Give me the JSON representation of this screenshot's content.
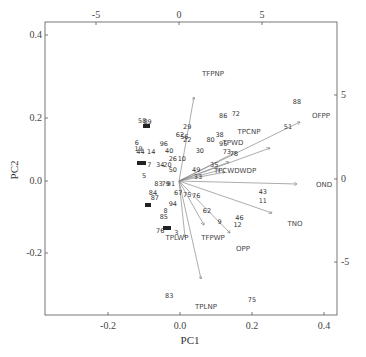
{
  "chart_data": {
    "type": "scatter",
    "subtype": "pca-biplot",
    "title": "",
    "xlabel": "PC1",
    "ylabel": "PC2",
    "xlim": [
      -0.37,
      0.44
    ],
    "ylim": [
      -0.42,
      0.44
    ],
    "xticks": [
      "-0.2",
      "0.0",
      "0.2",
      "0.4"
    ],
    "yticks": [
      "0.4",
      "0.2",
      "0.0",
      "-0.2"
    ],
    "top_ticks": [
      "-5",
      "0",
      "5"
    ],
    "right_ticks": [
      "5",
      "0",
      "-5"
    ],
    "grid": false,
    "legend": null,
    "variables": [
      {
        "name": "TFPNP",
        "end": [
          0.025,
          0.265
        ]
      },
      {
        "name": "OFPP",
        "end": [
          0.35,
          0.17
        ]
      },
      {
        "name": "TPCNP",
        "end": [
          0.25,
          0.09
        ]
      },
      {
        "name": "TPWD",
        "end": [
          0.2,
          0.06
        ]
      },
      {
        "name": "TPCWDWDP",
        "end": [
          0.2,
          0.02
        ]
      },
      {
        "name": "OND",
        "end": [
          0.33,
          -0.005
        ]
      },
      {
        "name": "TNO",
        "end": [
          0.27,
          -0.11
        ]
      },
      {
        "name": "OPP",
        "end": [
          0.2,
          -0.17
        ]
      },
      {
        "name": "TFPWP",
        "end": [
          0.14,
          -0.125
        ]
      },
      {
        "name": "TPLWP",
        "end": [
          0.06,
          -0.17
        ]
      },
      {
        "name": "TPLNP",
        "end": [
          0.065,
          -0.28
        ]
      }
    ],
    "observations": [
      {
        "label": "88",
        "x": 0.325,
        "y": 0.245
      },
      {
        "label": "51",
        "x": 0.3,
        "y": 0.165
      },
      {
        "label": "86",
        "x": 0.12,
        "y": 0.2
      },
      {
        "label": "72",
        "x": 0.155,
        "y": 0.205
      },
      {
        "label": "29",
        "x": 0.02,
        "y": 0.165
      },
      {
        "label": "38",
        "x": 0.11,
        "y": 0.14
      },
      {
        "label": "80",
        "x": 0.085,
        "y": 0.125
      },
      {
        "label": "95",
        "x": 0.12,
        "y": 0.11
      },
      {
        "label": "73",
        "x": 0.13,
        "y": 0.085
      },
      {
        "label": "78",
        "x": 0.15,
        "y": 0.08
      },
      {
        "label": "30",
        "x": 0.055,
        "y": 0.09
      },
      {
        "label": "62",
        "x": 0.0,
        "y": 0.14
      },
      {
        "label": "56",
        "x": 0.012,
        "y": 0.135
      },
      {
        "label": "22",
        "x": 0.02,
        "y": 0.125
      },
      {
        "label": "58",
        "x": -0.105,
        "y": 0.185
      },
      {
        "label": "89",
        "x": -0.09,
        "y": 0.18
      },
      {
        "label": "6",
        "x": -0.12,
        "y": 0.115
      },
      {
        "label": "19",
        "x": -0.115,
        "y": 0.095
      },
      {
        "label": "14",
        "x": -0.08,
        "y": 0.085
      },
      {
        "label": "44",
        "x": -0.11,
        "y": 0.085
      },
      {
        "label": "96",
        "x": -0.045,
        "y": 0.11
      },
      {
        "label": "40",
        "x": -0.03,
        "y": 0.09
      },
      {
        "label": "26",
        "x": -0.02,
        "y": 0.065
      },
      {
        "label": "10",
        "x": 0.005,
        "y": 0.065
      },
      {
        "label": "7",
        "x": -0.085,
        "y": 0.045
      },
      {
        "label": "34",
        "x": -0.055,
        "y": 0.045
      },
      {
        "label": "20",
        "x": -0.035,
        "y": 0.045
      },
      {
        "label": "50",
        "x": -0.02,
        "y": 0.03
      },
      {
        "label": "5",
        "x": -0.1,
        "y": 0.01
      },
      {
        "label": "43",
        "x": 0.23,
        "y": -0.04
      },
      {
        "label": "11",
        "x": 0.23,
        "y": -0.07
      },
      {
        "label": "35",
        "x": 0.095,
        "y": 0.045
      },
      {
        "label": "49",
        "x": 0.045,
        "y": 0.03
      },
      {
        "label": "33",
        "x": 0.05,
        "y": 0.005
      },
      {
        "label": "83",
        "x": -0.06,
        "y": -0.015
      },
      {
        "label": "79",
        "x": -0.04,
        "y": -0.015
      },
      {
        "label": "91",
        "x": -0.025,
        "y": -0.015
      },
      {
        "label": "67",
        "x": -0.005,
        "y": -0.045
      },
      {
        "label": "75",
        "x": 0.02,
        "y": -0.05
      },
      {
        "label": "76",
        "x": 0.045,
        "y": -0.055
      },
      {
        "label": "84",
        "x": -0.075,
        "y": -0.045
      },
      {
        "label": "87",
        "x": -0.07,
        "y": -0.06
      },
      {
        "label": "94",
        "x": -0.02,
        "y": -0.08
      },
      {
        "label": "8",
        "x": -0.04,
        "y": -0.1
      },
      {
        "label": "85",
        "x": -0.045,
        "y": -0.12
      },
      {
        "label": "62",
        "x": 0.075,
        "y": -0.1
      },
      {
        "label": "9",
        "x": 0.11,
        "y": -0.135
      },
      {
        "label": "46",
        "x": 0.165,
        "y": -0.125
      },
      {
        "label": "12",
        "x": 0.16,
        "y": -0.145
      },
      {
        "label": "76",
        "x": -0.055,
        "y": -0.165
      },
      {
        "label": "3",
        "x": -0.01,
        "y": -0.17
      },
      {
        "label": "83",
        "x": -0.03,
        "y": -0.37
      },
      {
        "label": "75",
        "x": 0.2,
        "y": -0.385
      }
    ]
  },
  "axes": {
    "x_label": "PC1",
    "y_label": "PC2",
    "bottom_ticks": [
      "-0.2",
      "0.0",
      "0.2",
      "0.4"
    ],
    "left_ticks": [
      "0.4",
      "0.2",
      "0.0",
      "-0.2"
    ],
    "top_ticks": [
      "-5",
      "0",
      "5"
    ],
    "right_ticks": [
      "5",
      "0",
      "-5"
    ]
  }
}
